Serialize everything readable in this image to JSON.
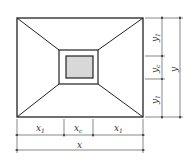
{
  "diagram": {
    "colors": {
      "stroke": "#222222",
      "dim": "#555555",
      "fill": "#d8d8d8"
    },
    "bottom_labels": {
      "left": "x",
      "left_sub": "1",
      "mid": "x",
      "mid_sub": "c",
      "right": "x",
      "right_sub": "1",
      "total": "x"
    },
    "right_labels": {
      "top": "y",
      "top_sub": "1",
      "mid": "y",
      "mid_sub": "c",
      "bottom": "y",
      "bottom_sub": "1",
      "total": "y"
    }
  }
}
